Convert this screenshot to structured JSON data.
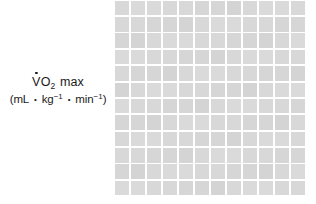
{
  "figure": {
    "background_color": "#ffffff",
    "width": 316,
    "height": 204
  },
  "axis_label": {
    "line1": {
      "variable": "V",
      "overdot": "˙",
      "species": "O",
      "subscript": "2",
      "qualifier": "max",
      "full_text": "V̇O2 max"
    },
    "line2": {
      "open_paren": "(",
      "unit_volume": "mL",
      "bullet": "•",
      "unit_mass": "kg",
      "mass_exponent": "−1",
      "unit_time": "min",
      "time_exponent": "−1",
      "close_paren": ")",
      "full_text": "(mL • kg−1 • min−1)"
    }
  },
  "chart_data": {
    "type": "line",
    "title": "",
    "subtitle": "",
    "xlabel": "",
    "ylabel": "V̇O2 max (mL • kg−1 • min−1)",
    "series": [],
    "categories": [],
    "values": [],
    "annotations": [],
    "legend": {
      "entries": [],
      "position": "none"
    },
    "grid": {
      "visible": true,
      "columns": 12,
      "rows": 12,
      "cell_width_px": 16,
      "cell_height_px": 16,
      "cell_color": "#d8d8d8",
      "line_color": "#ffffff",
      "line_width_px": 2,
      "note": "blank graph-paper plotting area; no data plotted, no tick labels"
    },
    "axes": {
      "x_ticks": [],
      "y_ticks": [],
      "xlim": [],
      "ylim": [],
      "x_tick_labels_visible": false,
      "y_tick_labels_visible": false
    }
  },
  "colors": {
    "background": "#ffffff",
    "text": "#1a1a1a",
    "grid_cell": "#d8d8d8",
    "grid_line": "#ffffff"
  }
}
